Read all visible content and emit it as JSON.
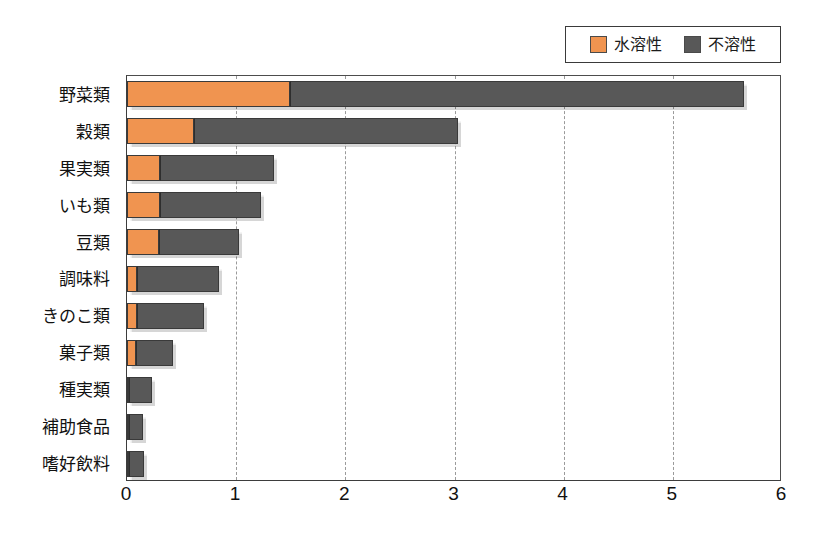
{
  "chart_data": {
    "type": "bar",
    "orientation": "horizontal",
    "stacked": true,
    "title": "",
    "xlabel": "",
    "ylabel": "",
    "xlim": [
      0,
      6
    ],
    "xticks": [
      "0",
      "1",
      "2",
      "3",
      "4",
      "5",
      "6"
    ],
    "grid": "vertical-dashed",
    "legend_position": "top-right",
    "categories": [
      "野菜類",
      "穀類",
      "果実類",
      "いも類",
      "豆類",
      "調味料",
      "きのこ類",
      "菓子類",
      "種実類",
      "補助食品",
      "嗜好飲料"
    ],
    "series": [
      {
        "name": "水溶性",
        "color": "#f09450",
        "values": [
          1.49,
          0.61,
          0.3,
          0.3,
          0.29,
          0.09,
          0.09,
          0.08,
          0.02,
          0.01,
          0.01
        ]
      },
      {
        "name": "不溶性",
        "color": "#585858",
        "values": [
          4.16,
          2.42,
          1.05,
          0.93,
          0.74,
          0.75,
          0.62,
          0.34,
          0.21,
          0.13,
          0.14
        ]
      }
    ],
    "totals": [
      5.65,
      3.03,
      1.35,
      1.23,
      1.03,
      0.84,
      0.71,
      0.42,
      0.23,
      0.14,
      0.15
    ]
  },
  "legend": {
    "entries": [
      {
        "label": "水溶性",
        "color": "#f09450"
      },
      {
        "label": "不溶性",
        "color": "#585858"
      }
    ]
  }
}
